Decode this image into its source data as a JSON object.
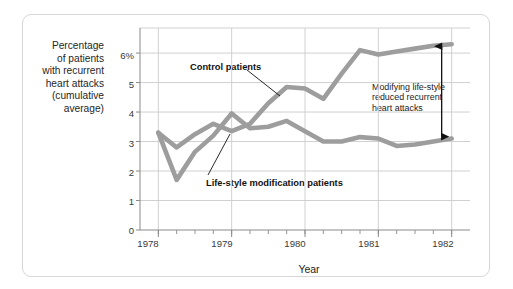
{
  "chart_data": {
    "type": "line",
    "title": "",
    "xlabel": "Year",
    "ylabel": "Percentage of patients with recurrent heart attacks (cumulative average)",
    "ylabel_lines": [
      "Percentage",
      "of patients",
      "with recurrent",
      "heart attacks",
      "(cumulative",
      "average)"
    ],
    "xlim": [
      1977.75,
      1982.25
    ],
    "ylim": [
      0,
      6.85
    ],
    "grid": true,
    "legend_position": "inline-callouts",
    "y_ticks": [
      0,
      1,
      2,
      3,
      4,
      5,
      6
    ],
    "y_tick_labels": [
      "0",
      "1",
      "2",
      "3",
      "4",
      "5",
      "6%"
    ],
    "x_ticks": [
      1978,
      1979,
      1980,
      1981,
      1982
    ],
    "x_tick_labels": [
      "1978",
      "1979",
      "1980",
      "1981",
      "1982"
    ],
    "x_minor_ticks_per_year": 4,
    "series": [
      {
        "name": "Control patients",
        "color": "#9d9d9d",
        "x": [
          1978.0,
          1978.25,
          1978.5,
          1978.75,
          1979.0,
          1979.25,
          1979.5,
          1979.75,
          1980.0,
          1980.25,
          1980.5,
          1980.75,
          1981.0,
          1981.25,
          1981.5,
          1981.75,
          1982.0
        ],
        "values": [
          3.3,
          2.8,
          3.25,
          3.6,
          3.35,
          3.6,
          4.3,
          4.85,
          4.8,
          4.45,
          5.3,
          6.1,
          5.95,
          6.05,
          6.15,
          6.25,
          6.3
        ]
      },
      {
        "name": "Life-style modification patients",
        "color": "#9d9d9d",
        "x": [
          1978.0,
          1978.25,
          1978.5,
          1978.75,
          1979.0,
          1979.25,
          1979.5,
          1979.75,
          1980.0,
          1980.25,
          1980.5,
          1980.75,
          1981.0,
          1981.25,
          1981.5,
          1981.75,
          1982.0
        ],
        "values": [
          3.3,
          1.7,
          2.65,
          3.2,
          3.95,
          3.45,
          3.5,
          3.7,
          3.35,
          3.0,
          3.0,
          3.15,
          3.1,
          2.85,
          2.9,
          3.0,
          3.1
        ]
      }
    ],
    "callouts": [
      {
        "id": "control-callout",
        "text": "Control patients",
        "x": 1978.85,
        "y": 5.55
      },
      {
        "id": "lifestyle-callout",
        "text": "Life-style modification patients",
        "x": 1978.9,
        "y": 1.6
      }
    ],
    "annotations": [
      {
        "id": "reduction-annotation",
        "lines": [
          "Modifying life-style",
          "reduced recurrent",
          "heart attacks"
        ],
        "arrow": {
          "type": "double-headed-vertical",
          "x": 1982.0,
          "y_top": 6.3,
          "y_bottom": 3.1
        }
      }
    ],
    "colors": {
      "line": "#9d9d9d",
      "grid": "#d0d0d0",
      "axis": "#8a8a8a",
      "text": "#1c1c1c",
      "frame": "#d7d7d7",
      "background": "#ffffff",
      "arrow": "#111111"
    }
  }
}
